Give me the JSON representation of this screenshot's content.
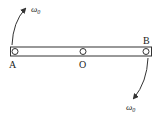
{
  "diagram": {
    "type": "rotating-rod",
    "labels": {
      "left_end": "A",
      "center": "O",
      "right_end": "B",
      "omega_top": "ω",
      "omega_top_sub": "0",
      "omega_bottom": "ω",
      "omega_bottom_sub": "0"
    },
    "colors": {
      "stroke": "#333333",
      "background": "#ffffff"
    }
  }
}
